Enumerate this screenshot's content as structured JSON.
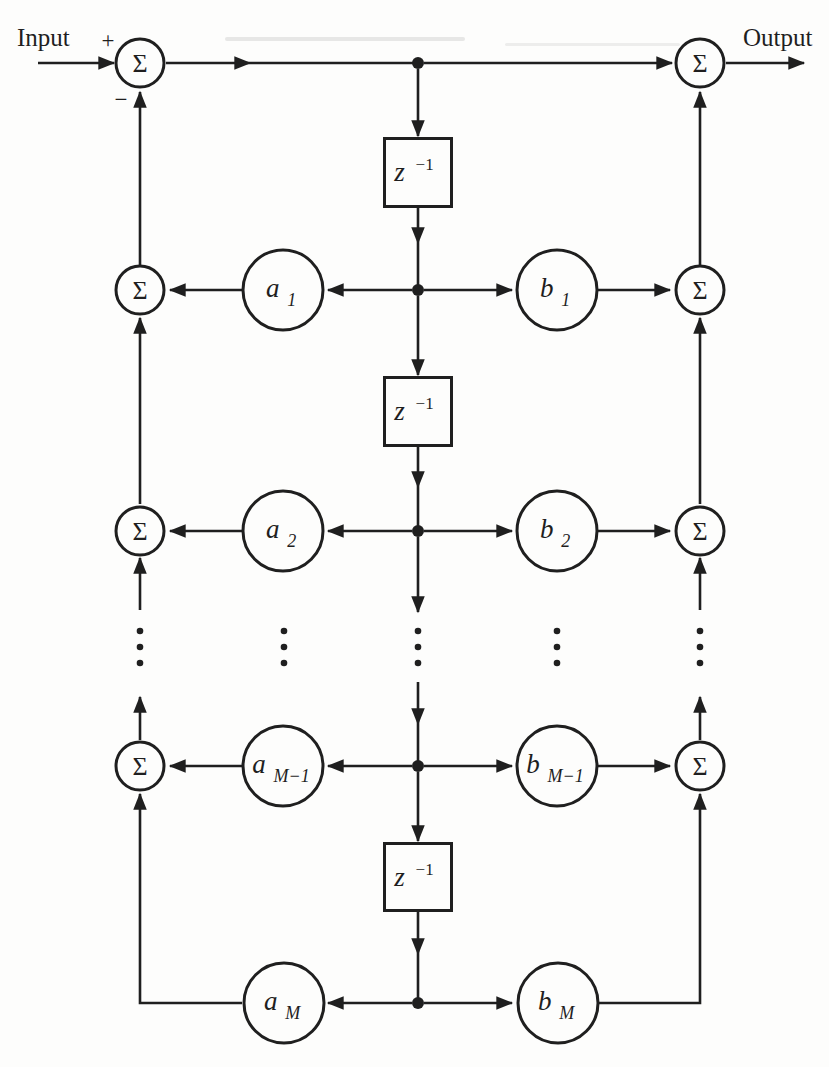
{
  "io": {
    "input_label": "Input",
    "output_label": "Output",
    "plus_sign": "+",
    "minus_sign": "−"
  },
  "symbols": {
    "sigma": "Σ"
  },
  "delay": {
    "base": "z",
    "sup": "−1"
  },
  "coefficients": {
    "a": [
      {
        "base": "a",
        "sub": "1"
      },
      {
        "base": "a",
        "sub": "2"
      },
      {
        "base": "a",
        "sub": "M−1"
      },
      {
        "base": "a",
        "sub": "M"
      }
    ],
    "b": [
      {
        "base": "b",
        "sub": "1"
      },
      {
        "base": "b",
        "sub": "2"
      },
      {
        "base": "b",
        "sub": "M−1"
      },
      {
        "base": "b",
        "sub": "M"
      }
    ]
  },
  "colors": {
    "ink": "#1f1f1f",
    "background": "#fdfdfc"
  }
}
